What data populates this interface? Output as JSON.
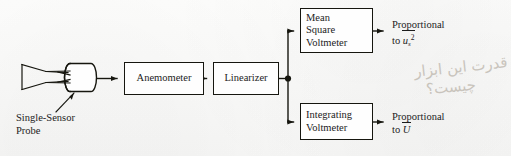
{
  "figure": {
    "type": "block-diagram",
    "background_color": "#fdfdfc",
    "line_color": "#16160f"
  },
  "probe": {
    "name": "single-sensor-probe",
    "label_line_1": "Single-Sensor",
    "label_line_2": "Probe"
  },
  "blocks": [
    {
      "id": "anemometer",
      "lines": [
        "Anemometer"
      ],
      "align": "center"
    },
    {
      "id": "linearizer",
      "lines": [
        "Linearizer"
      ],
      "align": "center"
    },
    {
      "id": "mean-square",
      "lines": [
        "Mean",
        "Square",
        "Voltmeter"
      ],
      "align": "left"
    },
    {
      "id": "integrating",
      "lines": [
        "Integrating",
        "Voltmeter"
      ],
      "align": "left"
    }
  ],
  "outputs": {
    "top": {
      "line_1": "Proportional",
      "prefix": "to ",
      "symbol": "u",
      "subscript": "s",
      "superscript": "2",
      "overbar": true
    },
    "bottom": {
      "line_1": "Proportional",
      "prefix": "to ",
      "symbol": "U",
      "subscript": "",
      "superscript": "",
      "overbar": true
    }
  },
  "annotation": {
    "script": "persian-handwriting",
    "line_1": "قدرت این ابزار",
    "line_2": "چیست؟"
  }
}
